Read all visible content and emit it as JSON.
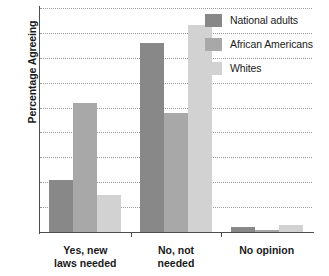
{
  "chart_data": {
    "type": "bar",
    "title": "",
    "xlabel": "",
    "ylabel": "Percentage Agreeing",
    "categories": [
      "Yes, new\nlaws needed",
      "No, not\nneeded",
      "No opinion"
    ],
    "series": [
      {
        "name": "National adults",
        "color": "#888888",
        "values": [
          21,
          76,
          2
        ]
      },
      {
        "name": "African Americans",
        "color": "#a8a8a8",
        "values": [
          52,
          48,
          1
        ]
      },
      {
        "name": "Whites",
        "color": "#d2d2d2",
        "values": [
          15,
          83,
          3
        ]
      }
    ],
    "ylim": [
      0,
      90
    ],
    "yticks": [
      0,
      10,
      20,
      30,
      40,
      50,
      60,
      70,
      80,
      90
    ],
    "grid": true,
    "legend_position": "top-right"
  },
  "axis": {
    "y_title": "Percentage Agreeing",
    "tick_labels": [
      "90",
      "80",
      "70",
      "60",
      "50",
      "40",
      "30",
      "20",
      "10",
      "0"
    ]
  },
  "legend": {
    "items": [
      {
        "label": "National adults",
        "swatch": "#888888"
      },
      {
        "label": "African Americans",
        "swatch": "#a8a8a8"
      },
      {
        "label": "Whites",
        "swatch": "#d2d2d2"
      }
    ]
  },
  "categories_display": [
    {
      "line1": "Yes, new",
      "line2": "laws needed"
    },
    {
      "line1": "No, not",
      "line2": "needed"
    },
    {
      "line1": "No opinion",
      "line2": ""
    }
  ]
}
